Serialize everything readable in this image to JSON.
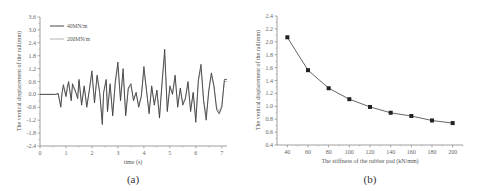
{
  "chart_data": [
    {
      "id": "a",
      "type": "line",
      "caption": "(a)",
      "title": "",
      "xlabel": "time (s)",
      "ylabel": "The vertical displacement of the rail(mm)",
      "xlim": [
        0,
        7.2
      ],
      "ylim": [
        -2.4,
        3.6
      ],
      "xticks": [
        0,
        1,
        2,
        3,
        4,
        5,
        6,
        7
      ],
      "yticks": [
        -2.4,
        -1.8,
        -1.2,
        -0.6,
        0.0,
        0.6,
        1.2,
        1.8,
        2.4,
        3.0,
        3.6
      ],
      "ytick_labels": [
        "-2.4",
        "-1.8",
        "-1.2",
        "-0.6",
        "0.0",
        "0.6",
        "1.2",
        "1.8",
        "2.4",
        "3.0",
        "3.6"
      ],
      "grid": false,
      "legend_position": "upper left",
      "series": [
        {
          "name": "40MN/m",
          "color": "#333333",
          "x": [
            0,
            0.6,
            0.7,
            0.8,
            0.85,
            0.9,
            1.0,
            1.05,
            1.1,
            1.2,
            1.25,
            1.35,
            1.45,
            1.5,
            1.6,
            1.7,
            1.8,
            1.9,
            2.0,
            2.1,
            2.2,
            2.3,
            2.4,
            2.45,
            2.55,
            2.6,
            2.7,
            2.8,
            2.9,
            3.0,
            3.1,
            3.2,
            3.3,
            3.4,
            3.5,
            3.6,
            3.7,
            3.8,
            3.9,
            4.0,
            4.1,
            4.2,
            4.3,
            4.4,
            4.5,
            4.6,
            4.7,
            4.8,
            4.9,
            5.0,
            5.1,
            5.2,
            5.3,
            5.4,
            5.5,
            5.6,
            5.7,
            5.8,
            5.9,
            6.0,
            6.1,
            6.2,
            6.3,
            6.4,
            6.5,
            6.6,
            6.7,
            6.8,
            6.9,
            7.0,
            7.1,
            7.2
          ],
          "y": [
            0,
            0,
            0.05,
            -0.6,
            0.1,
            0.45,
            -0.1,
            0.35,
            0.6,
            -0.3,
            0.5,
            0.2,
            -0.2,
            0.7,
            -0.5,
            0.4,
            -0.6,
            0.2,
            1.1,
            -0.4,
            0.9,
            0.1,
            -1.4,
            0.1,
            0.7,
            -0.8,
            0.5,
            -1.0,
            0.6,
            1.5,
            -0.3,
            1.2,
            -1.0,
            0.3,
            0.5,
            -0.3,
            0.1,
            -0.6,
            -0.1,
            1.3,
            0.2,
            -0.9,
            0.4,
            -0.5,
            0.2,
            -1.1,
            0.6,
            2.1,
            -0.8,
            0.4,
            0.0,
            0.9,
            -0.6,
            0.3,
            -0.5,
            -0.2,
            0.6,
            -0.8,
            0.1,
            -1.3,
            0.7,
            1.4,
            -0.3,
            -1.2,
            0.2,
            1.0,
            0.4,
            -0.7,
            -0.9,
            -0.6,
            0.7,
            0.7
          ]
        },
        {
          "name": "200MN/m",
          "color": "#aaaaaa",
          "x": [
            0,
            0.6,
            0.7,
            0.8,
            0.85,
            0.9,
            1.0,
            1.05,
            1.1,
            1.2,
            1.25,
            1.35,
            1.45,
            1.5,
            1.6,
            1.7,
            1.8,
            1.9,
            2.0,
            2.1,
            2.2,
            2.3,
            2.4,
            2.45,
            2.55,
            2.6,
            2.7,
            2.8,
            2.9,
            3.0,
            3.1,
            3.2,
            3.3,
            3.4,
            3.5,
            3.6,
            3.7,
            3.8,
            3.9,
            4.0,
            4.1,
            4.2,
            4.3,
            4.4,
            4.5,
            4.6,
            4.7,
            4.8,
            4.9,
            5.0,
            5.1,
            5.2,
            5.3,
            5.4,
            5.5,
            5.6,
            5.7,
            5.8,
            5.9,
            6.0,
            6.1,
            6.2,
            6.3,
            6.4,
            6.5,
            6.6,
            6.7,
            6.8,
            6.9,
            7.0,
            7.1,
            7.2
          ],
          "y": [
            0,
            0,
            0.0,
            -0.5,
            0.05,
            0.35,
            -0.05,
            0.25,
            0.5,
            -0.2,
            0.4,
            0.15,
            -0.1,
            0.6,
            -0.4,
            0.3,
            -0.5,
            0.15,
            0.95,
            -0.3,
            0.8,
            0.05,
            -1.2,
            0.05,
            0.6,
            -0.7,
            0.4,
            -0.9,
            0.5,
            1.3,
            -0.2,
            1.0,
            -0.9,
            0.25,
            0.4,
            -0.2,
            0.05,
            -0.5,
            -0.05,
            1.1,
            0.15,
            -0.8,
            0.3,
            -0.4,
            0.15,
            -1.0,
            0.5,
            1.8,
            -0.7,
            0.3,
            0.05,
            0.8,
            -0.5,
            0.25,
            -0.4,
            -0.15,
            0.5,
            -0.7,
            0.05,
            -1.1,
            0.6,
            1.2,
            -0.25,
            -1.0,
            0.15,
            0.9,
            0.3,
            -0.6,
            -0.8,
            -0.5,
            0.6,
            0.6
          ]
        }
      ]
    },
    {
      "id": "b",
      "type": "line",
      "caption": "(b)",
      "title": "",
      "xlabel": "The stiffness of the rubber pad (kN/mm)",
      "ylabel": "The vertical displacement of the rail(mm)",
      "xlim": [
        30,
        210
      ],
      "ylim": [
        0.4,
        2.4
      ],
      "xticks": [
        40,
        60,
        80,
        100,
        120,
        140,
        160,
        180,
        200
      ],
      "yticks": [
        0.4,
        0.6,
        0.8,
        1.0,
        1.2,
        1.4,
        1.6,
        1.8,
        2.0,
        2.2,
        2.4
      ],
      "ytick_labels": [
        "0.4",
        "0.6",
        "0.8",
        "1.0",
        "1.2",
        "1.4",
        "1.6",
        "1.8",
        "2.0",
        "2.2",
        "2.4"
      ],
      "grid": false,
      "marker": "square",
      "series": [
        {
          "name": "displacement",
          "color": "#222222",
          "x": [
            40,
            60,
            80,
            100,
            120,
            140,
            160,
            180,
            200
          ],
          "y": [
            2.07,
            1.56,
            1.28,
            1.11,
            0.99,
            0.9,
            0.85,
            0.78,
            0.74
          ]
        }
      ]
    }
  ]
}
